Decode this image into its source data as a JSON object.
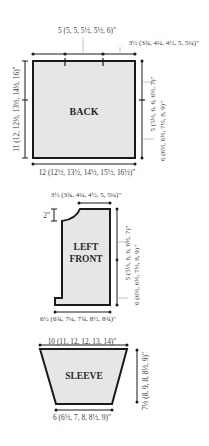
{
  "colors": {
    "outline": "#1a1a1a",
    "fill": "#e6e6e6",
    "text": "#3a3a3a",
    "leader": "#9a9a9a",
    "background": "#ffffff"
  },
  "back": {
    "name": "BACK",
    "shoulder_width": "5 (5, 5, 5½, 5½, 6)\"",
    "neck_width": "3½ (3¾, 4¼, 4½, 5, 5¼)\"",
    "total_length": "11 (12, 12½, 13½, 14½, 16)\"",
    "armhole_depth": "5 (5½, 6, 6, 6½, 7)\"",
    "side_length": "6 (6½, 6½, 7½, 8, 9)\"",
    "width": "12 (12½, 13½, 14½, 15½, 16½)\""
  },
  "left_front": {
    "name_line1": "LEFT",
    "name_line2": "FRONT",
    "shoulder_width": "3½ (3¾, 4¼, 4½, 5, 5¼)\"",
    "neck_drop": "2\"",
    "armhole_depth": "5 (5½, 6, 6, 6½, 7)\"",
    "side_length": "6 (6½, 6½, 7½, 8, 9)\"",
    "width": "6½ (6¾, 7¼, 7¾, 8½, 8¾)\""
  },
  "sleeve": {
    "name": "SLEEVE",
    "top_width": "10 (11, 12, 12, 13, 14)\"",
    "length": "7½ (8, 9, 8, 8½, 9)\"",
    "cuff_width": "6 (6½, 7, 8, 8½, 9)\""
  }
}
